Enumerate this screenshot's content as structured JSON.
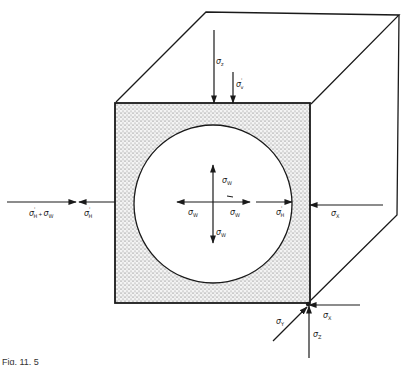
{
  "figure": {
    "caption_partial": "Fig. 11. 5",
    "colors": {
      "line": "#1a1a1a",
      "fill_stipple": "#cfcfcf",
      "background": "#ffffff"
    },
    "labels": {
      "sigma_z_top": "σ",
      "sigma_z_top_sub": "z",
      "sigma_v_prime": "σ",
      "sigma_v_prime_sub": "v",
      "sigma_h_prime_plus_w": "σ",
      "sigma_h_prime_plus_w_sub": "H",
      "plus": "+",
      "sigma_w_after_plus": "σ",
      "sigma_w_after_plus_sub": "W",
      "sigma_h_prime_left": "σ",
      "sigma_h_prime_left_sub": "H",
      "sigma_w_up": "σ",
      "sigma_w_up_sub": "W",
      "sigma_w_left": "σ",
      "sigma_w_left_sub": "W",
      "sigma_w_right": "σ",
      "sigma_w_right_sub": "W",
      "sigma_w_down": "σ",
      "sigma_w_down_sub": "W",
      "sigma_h_prime_wall": "σ",
      "sigma_h_prime_wall_sub": "H",
      "sigma_x_right": "σ",
      "sigma_x_right_sub": "X",
      "sigma_x_corner": "σ",
      "sigma_x_corner_sub": "X",
      "sigma_y_corner": "σ",
      "sigma_y_corner_sub": "Y",
      "sigma_z_corner": "σ",
      "sigma_z_corner_sub": "Z",
      "prime": "'"
    }
  }
}
